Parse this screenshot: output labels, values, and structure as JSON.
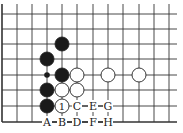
{
  "diagram": {
    "type": "go-board-fragment",
    "columns_x": [
      2,
      17,
      32,
      47,
      62,
      77,
      93,
      108,
      123,
      139,
      154,
      169
    ],
    "rows_y": [
      14,
      29,
      44,
      59,
      75,
      90,
      106,
      122
    ],
    "line_right_end": 177,
    "line_top_start": 4,
    "colors": {
      "line": "#333333",
      "black_stone": "#1a1a1a",
      "white_stone": "#ffffff",
      "background": "#ffffff"
    },
    "stones": [
      {
        "color": "black",
        "col": 4,
        "row": 2
      },
      {
        "color": "black",
        "col": 3,
        "row": 3
      },
      {
        "color": "black",
        "col": 4,
        "row": 4
      },
      {
        "color": "white",
        "col": 5,
        "row": 4
      },
      {
        "color": "white",
        "col": 7,
        "row": 4
      },
      {
        "color": "white",
        "col": 9,
        "row": 4
      },
      {
        "color": "black",
        "col": 3,
        "row": 5
      },
      {
        "color": "white",
        "col": 4,
        "row": 5
      },
      {
        "color": "white",
        "col": 5,
        "row": 5
      },
      {
        "color": "black",
        "col": 3,
        "row": 6
      },
      {
        "color": "white",
        "col": 4,
        "row": 6,
        "label": "1"
      }
    ],
    "markers": [
      {
        "type": "small-black-dot",
        "col": 3,
        "row": 4
      }
    ],
    "labels": [
      {
        "text": "C",
        "col": 5,
        "row": 6
      },
      {
        "text": "E",
        "col": 6,
        "row": 6
      },
      {
        "text": "G",
        "col": 7,
        "row": 6
      },
      {
        "text": "A",
        "col": 3,
        "row": 7
      },
      {
        "text": "B",
        "col": 4,
        "row": 7
      },
      {
        "text": "D",
        "col": 5,
        "row": 7
      },
      {
        "text": "F",
        "col": 6,
        "row": 7
      },
      {
        "text": "H",
        "col": 7,
        "row": 7
      }
    ]
  }
}
